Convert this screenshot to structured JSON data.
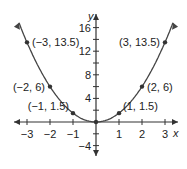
{
  "chart_data": {
    "type": "line",
    "title": "",
    "xlabel": "x",
    "ylabel": "y",
    "function": "y = 1.5x^2",
    "xlim": [
      -3.5,
      3.5
    ],
    "ylim": [
      -5,
      17
    ],
    "x_ticks": [
      -3,
      -2,
      -1,
      1,
      2,
      3
    ],
    "y_tick_labels": [
      16,
      12,
      8,
      4,
      -4
    ],
    "grid": false,
    "points": [
      {
        "x": -3,
        "y": 13.5,
        "label": "(−3, 13.5)"
      },
      {
        "x": -2,
        "y": 6,
        "label": "(−2, 6)"
      },
      {
        "x": -1,
        "y": 1.5,
        "label": "(−1, 1.5)"
      },
      {
        "x": 0,
        "y": 0,
        "label": ""
      },
      {
        "x": 1,
        "y": 1.5,
        "label": "(1, 1.5)"
      },
      {
        "x": 2,
        "y": 6,
        "label": "(2, 6)"
      },
      {
        "x": 3,
        "y": 13.5,
        "label": "(3, 13.5)"
      }
    ]
  }
}
